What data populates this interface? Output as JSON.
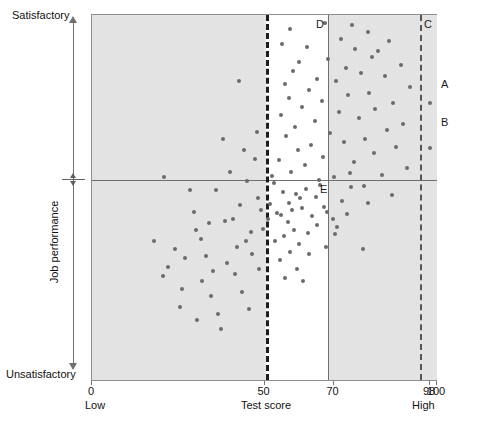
{
  "chart_data": {
    "type": "scatter",
    "title": "",
    "xlabel": "Test score",
    "ylabel": "Job performance",
    "xlim": [
      0,
      100
    ],
    "ylim": [
      0,
      100
    ],
    "grid": false,
    "legend_position": "none",
    "x_ticks": [
      {
        "value": 0,
        "label": "0"
      },
      {
        "value": 50,
        "label": "50"
      },
      {
        "value": 70,
        "label": "70"
      },
      {
        "value": 98,
        "label": "98"
      },
      {
        "value": 100,
        "label": "100"
      }
    ],
    "x_axis_end_labels": {
      "low": "Low",
      "high": "High"
    },
    "y_axis_end_labels": {
      "low": "Unsatisfactory",
      "high": "Satisfactory"
    },
    "reference_lines": [
      {
        "name": "performance-cutoff",
        "orientation": "horizontal",
        "value": 55,
        "style": "solid"
      },
      {
        "name": "test-cutoff-50",
        "orientation": "vertical",
        "value": 50,
        "style": "dashed"
      },
      {
        "name": "test-cutoff-70",
        "orientation": "vertical",
        "value": 70,
        "style": "solid"
      },
      {
        "name": "test-cutoff-98",
        "orientation": "vertical",
        "value": 98,
        "style": "dashed"
      }
    ],
    "region_labels": [
      {
        "id": "A",
        "label": "A"
      },
      {
        "id": "B",
        "label": "B"
      },
      {
        "id": "C",
        "label": "C"
      },
      {
        "id": "D",
        "label": "D"
      },
      {
        "id": "E",
        "label": "E"
      }
    ],
    "shaded_quadrants": [
      "top-left",
      "top-right",
      "bottom-left",
      "bottom-right"
    ],
    "points": [
      [
        67.6,
        97.8
      ],
      [
        75.4,
        97.3
      ],
      [
        57.5,
        96.2
      ],
      [
        79.9,
        95.4
      ],
      [
        72.1,
        93.5
      ],
      [
        86.1,
        92.9
      ],
      [
        55.1,
        92.0
      ],
      [
        62.3,
        91.3
      ],
      [
        76.2,
        90.7
      ],
      [
        83.0,
        90.1
      ],
      [
        81.3,
        88.6
      ],
      [
        68.4,
        87.9
      ],
      [
        60.1,
        87.2
      ],
      [
        89.6,
        86.3
      ],
      [
        73.6,
        85.5
      ],
      [
        58.3,
        84.7
      ],
      [
        78.0,
        84.0
      ],
      [
        84.9,
        83.2
      ],
      [
        65.1,
        82.6
      ],
      [
        70.8,
        81.9
      ],
      [
        55.9,
        81.0
      ],
      [
        92.1,
        80.3
      ],
      [
        62.9,
        79.4
      ],
      [
        80.4,
        78.7
      ],
      [
        74.3,
        78.0
      ],
      [
        57.0,
        77.2
      ],
      [
        66.8,
        76.5
      ],
      [
        87.2,
        75.8
      ],
      [
        60.8,
        74.9
      ],
      [
        82.1,
        74.2
      ],
      [
        71.5,
        73.4
      ],
      [
        54.7,
        72.6
      ],
      [
        77.3,
        71.8
      ],
      [
        64.5,
        71.0
      ],
      [
        90.0,
        70.2
      ],
      [
        58.9,
        69.4
      ],
      [
        85.6,
        68.6
      ],
      [
        69.1,
        67.8
      ],
      [
        56.2,
        66.9
      ],
      [
        79.0,
        66.1
      ],
      [
        73.0,
        65.3
      ],
      [
        63.4,
        64.5
      ],
      [
        88.1,
        63.7
      ],
      [
        59.6,
        62.9
      ],
      [
        81.8,
        62.1
      ],
      [
        67.0,
        61.2
      ],
      [
        54.2,
        60.4
      ],
      [
        75.9,
        59.6
      ],
      [
        61.7,
        58.8
      ],
      [
        91.3,
        58.0
      ],
      [
        57.8,
        57.1
      ],
      [
        84.0,
        56.3
      ],
      [
        70.2,
        55.6
      ],
      [
        65.9,
        54.8
      ],
      [
        52.8,
        54.0
      ],
      [
        78.7,
        53.1
      ],
      [
        62.1,
        52.3
      ],
      [
        55.4,
        51.5
      ],
      [
        86.9,
        50.7
      ],
      [
        60.3,
        49.8
      ],
      [
        72.6,
        49.0
      ],
      [
        51.5,
        48.2
      ],
      [
        67.3,
        47.4
      ],
      [
        58.0,
        46.5
      ],
      [
        53.6,
        45.7
      ],
      [
        63.9,
        44.9
      ],
      [
        69.8,
        44.1
      ],
      [
        56.7,
        43.2
      ],
      [
        74.8,
        56.8
      ],
      [
        52.1,
        55.9
      ],
      [
        66.0,
        53.4
      ],
      [
        59.0,
        51.0
      ],
      [
        64.8,
        50.2
      ],
      [
        57.2,
        48.6
      ],
      [
        61.0,
        47.0
      ],
      [
        54.9,
        45.2
      ],
      [
        68.0,
        46.0
      ],
      [
        51.0,
        44.0
      ],
      [
        65.2,
        42.5
      ],
      [
        71.0,
        41.8
      ],
      [
        58.6,
        41.0
      ],
      [
        62.6,
        40.2
      ],
      [
        55.7,
        39.4
      ],
      [
        53.1,
        38.0
      ],
      [
        60.0,
        37.3
      ],
      [
        67.9,
        36.5
      ],
      [
        57.3,
        35.2
      ],
      [
        63.0,
        34.4
      ],
      [
        54.4,
        33.0
      ],
      [
        59.3,
        30.5
      ],
      [
        56.0,
        28.0
      ],
      [
        61.2,
        27.0
      ],
      [
        75.0,
        52.8
      ],
      [
        80.0,
        48.5
      ],
      [
        73.9,
        45.5
      ],
      [
        70.5,
        40.0
      ],
      [
        78.5,
        36.0
      ],
      [
        42.6,
        82.0
      ],
      [
        38.0,
        66.0
      ],
      [
        29.6,
        46.0
      ],
      [
        18.0,
        38.0
      ],
      [
        24.0,
        36.0
      ],
      [
        33.0,
        34.0
      ],
      [
        45.0,
        54.5
      ],
      [
        40.1,
        57.0
      ],
      [
        47.3,
        60.5
      ],
      [
        44.0,
        63.0
      ],
      [
        36.0,
        52.0
      ],
      [
        30.0,
        41.0
      ],
      [
        22.0,
        31.0
      ],
      [
        26.0,
        25.0
      ],
      [
        34.5,
        23.0
      ],
      [
        41.0,
        44.0
      ],
      [
        48.0,
        50.0
      ],
      [
        43.0,
        48.0
      ],
      [
        38.5,
        43.5
      ],
      [
        31.5,
        38.5
      ],
      [
        27.0,
        33.5
      ],
      [
        20.5,
        28.5
      ],
      [
        35.0,
        30.0
      ],
      [
        46.0,
        40.5
      ],
      [
        49.0,
        46.5
      ],
      [
        44.5,
        38.0
      ],
      [
        39.0,
        32.0
      ],
      [
        32.0,
        27.0
      ],
      [
        25.5,
        20.0
      ],
      [
        36.5,
        18.0
      ],
      [
        43.5,
        24.0
      ],
      [
        48.5,
        30.5
      ],
      [
        41.5,
        29.0
      ],
      [
        46.5,
        34.5
      ],
      [
        33.8,
        43.0
      ],
      [
        28.5,
        52.0
      ],
      [
        21.0,
        55.5
      ],
      [
        47.8,
        68.0
      ],
      [
        49.5,
        41.5
      ],
      [
        45.5,
        19.5
      ],
      [
        37.5,
        14.0
      ],
      [
        30.5,
        16.5
      ],
      [
        42.0,
        36.5
      ],
      [
        98.0,
        76.0
      ],
      [
        98.0,
        63.5
      ]
    ]
  }
}
